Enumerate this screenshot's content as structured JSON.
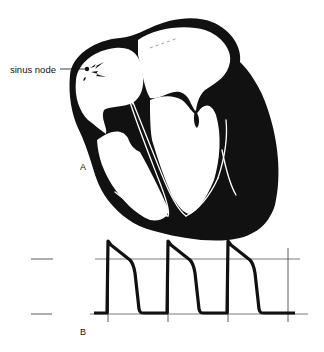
{
  "figure": {
    "panel_a": {
      "label": "A",
      "callouts": [
        {
          "text": "sinus node"
        }
      ]
    },
    "panel_b": {
      "label": "B",
      "waveform": {
        "type": "action-potential-train",
        "beats": 3
      }
    }
  },
  "colors": {
    "ink": "#111111",
    "background": "#ffffff"
  }
}
